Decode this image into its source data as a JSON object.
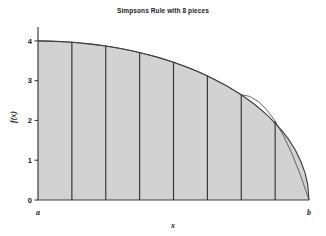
{
  "chart_data": {
    "type": "area",
    "title": "Simpsons Rule with 8 pieces",
    "xlabel": "x",
    "ylabel": "f(x)",
    "xlim": [
      0,
      1
    ],
    "ylim": [
      0,
      4.35
    ],
    "grid": false,
    "legend": null,
    "x_tick_labels": [
      "a",
      "b"
    ],
    "x_tick_values": [
      0,
      1
    ],
    "y_tick_labels": [
      "0",
      "1",
      "2",
      "3",
      "4"
    ],
    "y_tick_values": [
      0,
      1,
      2,
      3,
      4
    ],
    "n_pieces": 8,
    "fill_color": "#d2d2d2",
    "curve_color": "#3c3c3c",
    "divider_color": "#2b2b2b",
    "axis_color": "#3c3c3c",
    "function_description": "f(x) = 4*sqrt(1 - x^2)",
    "series": [
      {
        "name": "f(x)",
        "x": [
          0,
          0.05,
          0.1,
          0.15,
          0.2,
          0.25,
          0.3,
          0.35,
          0.4,
          0.45,
          0.5,
          0.55,
          0.6,
          0.65,
          0.7,
          0.75,
          0.8,
          0.85,
          0.9,
          0.925,
          0.95,
          0.97,
          0.985,
          0.995,
          1
        ],
        "values": [
          4.0,
          3.995,
          3.98,
          3.955,
          3.919,
          3.873,
          3.816,
          3.748,
          3.666,
          3.573,
          3.464,
          3.339,
          3.2,
          3.039,
          2.857,
          2.646,
          2.4,
          2.107,
          1.744,
          1.523,
          1.249,
          0.966,
          0.688,
          0.399,
          0.0
        ]
      }
    ],
    "piece_boundaries_x": [
      0,
      0.125,
      0.25,
      0.375,
      0.5,
      0.625,
      0.75,
      0.875,
      1
    ],
    "piece_boundaries_y": [
      4.0,
      3.969,
      3.873,
      3.708,
      3.464,
      3.122,
      2.646,
      1.984,
      0.0
    ],
    "simpson_node_values": [
      4.0,
      3.969,
      3.873,
      3.708,
      3.464,
      3.122,
      2.646,
      1.984,
      0.0
    ]
  }
}
